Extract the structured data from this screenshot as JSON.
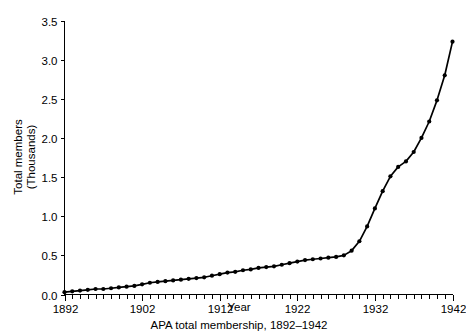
{
  "chart_data": {
    "type": "line",
    "title": "",
    "caption": "APA total membership, 1892–1942",
    "xlabel": "Year",
    "ylabel_line1": "Total members",
    "ylabel_line2": "(Thousands)",
    "ylabel": "Total members (Thousands)",
    "xlim": [
      1892,
      1942
    ],
    "ylim": [
      0.0,
      3.5
    ],
    "grid": false,
    "legend": "none",
    "x_major_ticks": [
      1892,
      1902,
      1912,
      1922,
      1932,
      1942
    ],
    "x_major_tick_labels": [
      "1892",
      "1902",
      "1912",
      "1922",
      "1932",
      "1942"
    ],
    "x_minor_tick_interval": 1,
    "y_ticks": [
      0.0,
      0.5,
      1.0,
      1.5,
      2.0,
      2.5,
      3.0,
      3.5
    ],
    "y_tick_labels": [
      "0.0",
      "0.5",
      "1.0",
      "1.5",
      "2.0",
      "2.5",
      "3.0",
      "3.5"
    ],
    "marker": "filled-circle",
    "line_color": "#000000",
    "series": [
      {
        "name": "APA total membership",
        "x": [
          1892,
          1893,
          1894,
          1895,
          1896,
          1897,
          1898,
          1899,
          1900,
          1901,
          1902,
          1903,
          1904,
          1905,
          1906,
          1907,
          1908,
          1909,
          1910,
          1911,
          1912,
          1913,
          1914,
          1915,
          1916,
          1917,
          1918,
          1919,
          1920,
          1921,
          1922,
          1923,
          1924,
          1925,
          1926,
          1927,
          1928,
          1929,
          1930,
          1931,
          1932,
          1933,
          1934,
          1935,
          1936,
          1937,
          1938,
          1939,
          1940,
          1941,
          1942
        ],
        "values": [
          0.03,
          0.04,
          0.05,
          0.06,
          0.07,
          0.07,
          0.08,
          0.09,
          0.1,
          0.11,
          0.13,
          0.15,
          0.16,
          0.17,
          0.18,
          0.19,
          0.2,
          0.21,
          0.22,
          0.24,
          0.26,
          0.28,
          0.29,
          0.31,
          0.32,
          0.34,
          0.35,
          0.36,
          0.38,
          0.4,
          0.42,
          0.44,
          0.45,
          0.46,
          0.47,
          0.48,
          0.5,
          0.56,
          0.68,
          0.87,
          1.1,
          1.32,
          1.51,
          1.63,
          1.7,
          1.82,
          2.0,
          2.21,
          2.48,
          2.8,
          3.23
        ]
      }
    ]
  }
}
